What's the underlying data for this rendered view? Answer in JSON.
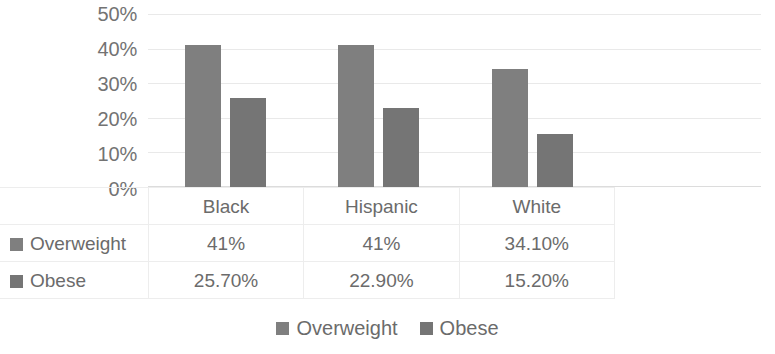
{
  "chart_data": {
    "type": "bar",
    "title": "",
    "xlabel": "",
    "ylabel": "",
    "categories": [
      "Black",
      "Hispanic",
      "White"
    ],
    "series": [
      {
        "name": "Overweight",
        "values": [
          41,
          41,
          34.1
        ],
        "labels": [
          "41%",
          "41%",
          "34.10%"
        ],
        "color": "#7f7f7f"
      },
      {
        "name": "Obese",
        "values": [
          25.7,
          22.9,
          15.2
        ],
        "labels": [
          "25.70%",
          "22.90%",
          "15.20%"
        ],
        "color": "#757575"
      }
    ],
    "ylim": [
      0,
      50
    ],
    "yticks": [
      50,
      40,
      30,
      20,
      10,
      0
    ],
    "ytick_labels": [
      "50%",
      "40%",
      "30%",
      "20%",
      "10%",
      "0%"
    ],
    "grid": true,
    "legend_position": "bottom",
    "data_table_visible": true
  },
  "table": {
    "header_row": [
      "",
      "Black",
      "Hispanic",
      "White"
    ],
    "rows": [
      {
        "label": "Overweight",
        "values": [
          "41%",
          "41%",
          "34.10%"
        ]
      },
      {
        "label": "Obese",
        "values": [
          "25.70%",
          "22.90%",
          "15.20%"
        ]
      }
    ]
  },
  "legend": {
    "items": [
      {
        "label": "Overweight"
      },
      {
        "label": "Obese"
      }
    ]
  }
}
